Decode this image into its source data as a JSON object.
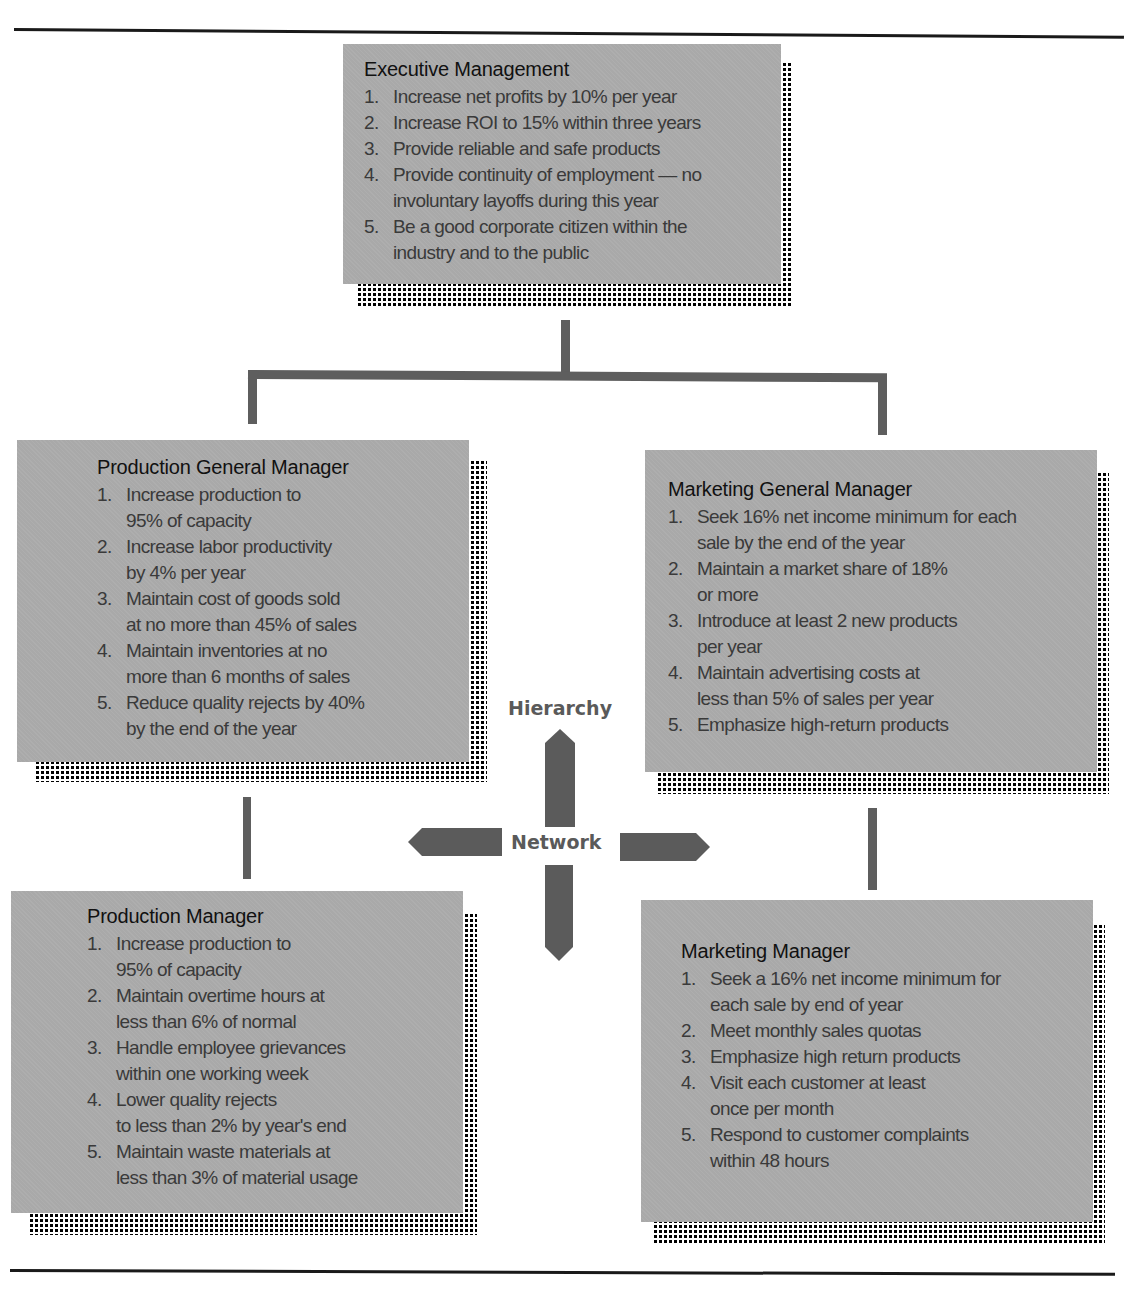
{
  "diagram": {
    "type": "organizational goal hierarchy",
    "axes": {
      "vertical_label": "Hierarchy",
      "horizontal_label": "Network"
    },
    "colors": {
      "box_fill": "#a9a9a9",
      "connector": "#5e5e5e",
      "arrow": "#5b5b5b",
      "rule": "#1a1a1a"
    },
    "boxes": {
      "executive": {
        "title": "Executive Management",
        "goals": [
          {
            "num": "1.",
            "text": "Increase net profits by 10% per year"
          },
          {
            "num": "2.",
            "text": "Increase ROI to 15% within three years"
          },
          {
            "num": "3.",
            "text": "Provide reliable and safe products"
          },
          {
            "num": "4.",
            "text": "Provide continuity of employment — no\ninvoluntary layoffs during this year"
          },
          {
            "num": "5.",
            "text": "Be a good corporate citizen within the\nindustry and to the public"
          }
        ]
      },
      "production_gm": {
        "title": "Production General Manager",
        "goals": [
          {
            "num": "1.",
            "text": "Increase production to\n95% of capacity"
          },
          {
            "num": "2.",
            "text": "Increase labor productivity\nby 4% per year"
          },
          {
            "num": "3.",
            "text": "Maintain cost of goods sold\nat no more than 45% of sales"
          },
          {
            "num": "4.",
            "text": "Maintain inventories at no\nmore than 6 months of sales"
          },
          {
            "num": "5.",
            "text": "Reduce quality rejects by 40%\nby the end of the year"
          }
        ]
      },
      "marketing_gm": {
        "title": "Marketing General Manager",
        "goals": [
          {
            "num": "1.",
            "text": "Seek 16% net income minimum for each\nsale by the end of the year"
          },
          {
            "num": "2.",
            "text": "Maintain a market share of 18%\nor more"
          },
          {
            "num": "3.",
            "text": "Introduce at least 2 new products\nper year"
          },
          {
            "num": "4.",
            "text": "Maintain advertising costs at\nless than 5% of sales per year"
          },
          {
            "num": "5.",
            "text": "Emphasize high-return products"
          }
        ]
      },
      "production_mgr": {
        "title": "Production Manager",
        "goals": [
          {
            "num": "1.",
            "text": "Increase production to\n95% of capacity"
          },
          {
            "num": "2.",
            "text": "Maintain overtime hours at\nless than 6% of normal"
          },
          {
            "num": "3.",
            "text": "Handle employee grievances\nwithin one working week"
          },
          {
            "num": "4.",
            "text": "Lower quality rejects\nto less than 2% by year's end"
          },
          {
            "num": "5.",
            "text": "Maintain waste materials at\nless than 3% of material usage"
          }
        ]
      },
      "marketing_mgr": {
        "title": "Marketing Manager",
        "goals": [
          {
            "num": "1.",
            "text": "Seek a 16% net income minimum for\neach sale by end of year"
          },
          {
            "num": "2.",
            "text": "Meet monthly sales quotas"
          },
          {
            "num": "3.",
            "text": "Emphasize high return products"
          },
          {
            "num": "4.",
            "text": "Visit each customer at least\nonce per month"
          },
          {
            "num": "5.",
            "text": "Respond to customer complaints\nwithin 48 hours"
          }
        ]
      }
    }
  }
}
